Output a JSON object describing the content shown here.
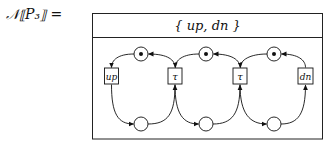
{
  "equation": {
    "lhs": "𝒩⟦P₃⟧ =",
    "header": "{ up, dn }"
  },
  "net": {
    "transitions": [
      {
        "id": "t1",
        "label": "up",
        "x": 111.5,
        "y": 76
      },
      {
        "id": "t2",
        "label": "τ",
        "x": 175,
        "y": 76
      },
      {
        "id": "t3",
        "label": "τ",
        "x": 240,
        "y": 76
      },
      {
        "id": "t4",
        "label": "dn",
        "x": 305.5,
        "y": 76
      }
    ],
    "places": [
      {
        "id": "p1",
        "x": 141,
        "y": 54,
        "marked": true
      },
      {
        "id": "p2",
        "x": 206,
        "y": 54,
        "marked": true
      },
      {
        "id": "p3",
        "x": 274,
        "y": 54,
        "marked": true
      },
      {
        "id": "q1",
        "x": 141,
        "y": 124,
        "marked": false
      },
      {
        "id": "q2",
        "x": 206,
        "y": 124,
        "marked": false
      },
      {
        "id": "q3",
        "x": 274,
        "y": 124,
        "marked": false
      }
    ]
  }
}
